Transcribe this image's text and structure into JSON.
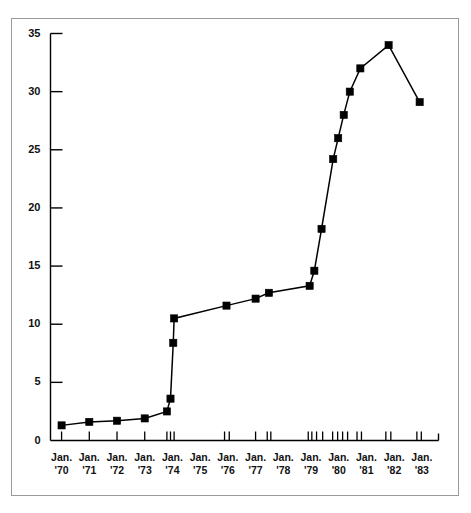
{
  "chart_data": {
    "type": "line",
    "title": "",
    "subtitle": "",
    "xlabel": "",
    "ylabel": "",
    "xlim": [
      1969.6,
      1983.6
    ],
    "ylim": [
      0,
      35
    ],
    "grid": false,
    "legend": null,
    "marker": "square",
    "line_color": "#000000",
    "marker_color": "#000000",
    "y_ticks": [
      0,
      5,
      10,
      15,
      20,
      25,
      30,
      35
    ],
    "y_ticklabels": [
      "0",
      "5",
      "10",
      "15",
      "20",
      "25",
      "30",
      "35"
    ],
    "x_ticklabels": [
      {
        "line1": "Jan.",
        "line2": "'70",
        "x": 1970
      },
      {
        "line1": "Jan.",
        "line2": "'71",
        "x": 1971
      },
      {
        "line1": "Jan.",
        "line2": "'72",
        "x": 1972
      },
      {
        "line1": "Jan.",
        "line2": "'73",
        "x": 1973
      },
      {
        "line1": "Jan.",
        "line2": "'74",
        "x": 1974
      },
      {
        "line1": "Jan.",
        "line2": "'75",
        "x": 1975
      },
      {
        "line1": "Jan.",
        "line2": "'76",
        "x": 1976
      },
      {
        "line1": "Jan.",
        "line2": "'77",
        "x": 1977
      },
      {
        "line1": "Jan.",
        "line2": "'78",
        "x": 1978
      },
      {
        "line1": "Jan.",
        "line2": "'79",
        "x": 1979
      },
      {
        "line1": "Jan.",
        "line2": "'80",
        "x": 1980
      },
      {
        "line1": "Jan.",
        "line2": "'81",
        "x": 1981
      },
      {
        "line1": "Jan.",
        "line2": "'82",
        "x": 1982
      },
      {
        "line1": "Jan.",
        "line2": "'83",
        "x": 1983
      }
    ],
    "x_minor_ticks": [
      1970.0,
      1971.0,
      1972.0,
      1973.0,
      1973.8,
      1973.93,
      1974.06,
      1975.88,
      1976.05,
      1977.0,
      1977.42,
      1977.55,
      1978.9,
      1979.03,
      1979.2,
      1979.42,
      1979.78,
      1979.96,
      1980.14,
      1980.32,
      1980.66,
      1980.82,
      1981.7,
      1981.88,
      1982.82,
      1982.98
    ],
    "points": [
      {
        "x": 1970.0,
        "y": 1.3
      },
      {
        "x": 1971.0,
        "y": 1.6
      },
      {
        "x": 1972.0,
        "y": 1.7
      },
      {
        "x": 1973.0,
        "y": 1.9
      },
      {
        "x": 1973.8,
        "y": 2.5
      },
      {
        "x": 1973.93,
        "y": 3.6
      },
      {
        "x": 1974.03,
        "y": 8.4
      },
      {
        "x": 1974.06,
        "y": 10.5
      },
      {
        "x": 1975.95,
        "y": 11.6
      },
      {
        "x": 1977.0,
        "y": 12.2
      },
      {
        "x": 1977.48,
        "y": 12.7
      },
      {
        "x": 1978.95,
        "y": 13.3
      },
      {
        "x": 1979.12,
        "y": 14.6
      },
      {
        "x": 1979.38,
        "y": 18.2
      },
      {
        "x": 1979.8,
        "y": 24.2
      },
      {
        "x": 1979.98,
        "y": 26.0
      },
      {
        "x": 1980.18,
        "y": 28.0
      },
      {
        "x": 1980.4,
        "y": 30.0
      },
      {
        "x": 1980.78,
        "y": 32.0
      },
      {
        "x": 1981.8,
        "y": 34.0
      },
      {
        "x": 1982.92,
        "y": 29.1
      }
    ]
  }
}
